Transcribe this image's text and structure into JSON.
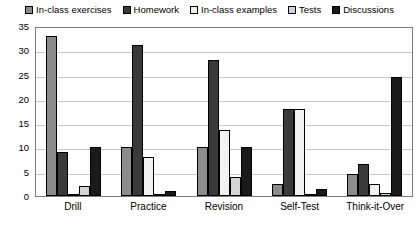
{
  "chart_data": {
    "type": "bar",
    "title": "",
    "xlabel": "",
    "ylabel": "",
    "ylim": [
      0,
      35
    ],
    "ytick_step": 5,
    "yticks": [
      35,
      30,
      25,
      20,
      15,
      10,
      5,
      0
    ],
    "grid": "horizontal",
    "legend_position": "top",
    "categories": [
      "Drill",
      "Practice",
      "Revision",
      "Self-Test",
      "Think-it-Over"
    ],
    "series": [
      {
        "name": "In-class exercises",
        "color": "#8c8c8c",
        "swatch": "gray-hatched-square",
        "values": [
          33,
          10,
          10,
          2.5,
          4.5
        ]
      },
      {
        "name": "Homework",
        "color": "#3a3a3a",
        "swatch": "dark-gray-square",
        "values": [
          9,
          31,
          28,
          18,
          6.5
        ]
      },
      {
        "name": "In-class examples",
        "color": "#f2f2f2",
        "swatch": "white-square",
        "values": [
          0.4,
          8,
          13.5,
          18,
          2.5
        ]
      },
      {
        "name": "Tests",
        "color": "#d4d4d4",
        "swatch": "light-gray-square",
        "values": [
          2,
          0.3,
          4,
          0.2,
          0.7
        ]
      },
      {
        "name": "Discussions",
        "color": "#1a1a1a",
        "swatch": "black-square",
        "values": [
          10,
          1,
          10,
          1.5,
          24.5
        ]
      }
    ]
  }
}
